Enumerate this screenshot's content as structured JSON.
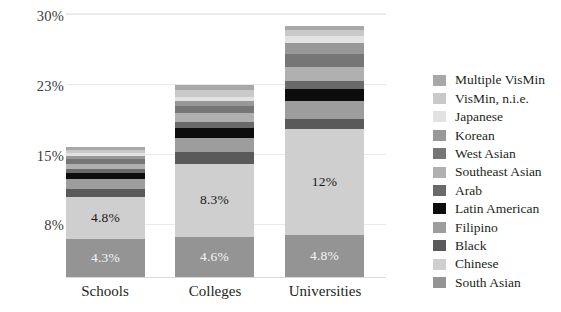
{
  "chart": {
    "type": "bar",
    "title": "",
    "xlabel": "",
    "ylabel": ""
  },
  "axis": {
    "y_ticks": [
      "30%",
      "23%",
      "15%",
      "8%"
    ],
    "x_categories": [
      "Schools",
      "Colleges",
      "Universities"
    ]
  },
  "legend": {
    "items": [
      {
        "label": "Multiple VisMin",
        "color": "#a8a8a8"
      },
      {
        "label": "VisMin, n.i.e.",
        "color": "#c9c9c9"
      },
      {
        "label": "Japanese",
        "color": "#e2e2e2"
      },
      {
        "label": "Korean",
        "color": "#989898"
      },
      {
        "label": "West Asian",
        "color": "#767676"
      },
      {
        "label": "Southeast Asian",
        "color": "#b0b0b0"
      },
      {
        "label": "Arab",
        "color": "#6a6a6a"
      },
      {
        "label": "Latin American",
        "color": "#0d0d0d"
      },
      {
        "label": "Filipino",
        "color": "#9d9d9d"
      },
      {
        "label": "Black",
        "color": "#5a5a5a"
      },
      {
        "label": "Chinese",
        "color": "#cfcfcf"
      },
      {
        "label": "South Asian",
        "color": "#949494"
      }
    ]
  },
  "chart_data": {
    "type": "bar",
    "subtype": "stacked-bar",
    "orientation": "vertical",
    "title": "",
    "xlabel": "",
    "ylabel": "",
    "ylim": [
      0,
      30
    ],
    "ytick_values": [
      8,
      15,
      23,
      30
    ],
    "ytick_labels": [
      "8%",
      "15%",
      "23%",
      "30%"
    ],
    "grid": true,
    "grid_axis": "y",
    "legend_position": "right",
    "categories": [
      "Schools",
      "Colleges",
      "Universities"
    ],
    "series": [
      {
        "name": "South Asian",
        "color": "#949494",
        "values": [
          4.3,
          4.6,
          4.8
        ],
        "labels": [
          "4.3%",
          "4.6%",
          "4.8%"
        ],
        "label_color": "light"
      },
      {
        "name": "Chinese",
        "color": "#cfcfcf",
        "values": [
          4.8,
          8.3,
          12.0
        ],
        "labels": [
          "4.8%",
          "8.3%",
          "12%"
        ],
        "label_color": "dark"
      },
      {
        "name": "Black",
        "color": "#5a5a5a",
        "values": [
          0.9,
          1.3,
          1.2
        ],
        "labels": [
          "",
          "",
          ""
        ]
      },
      {
        "name": "Filipino",
        "color": "#9d9d9d",
        "values": [
          1.1,
          1.6,
          2.0
        ],
        "labels": [
          "",
          "",
          ""
        ]
      },
      {
        "name": "Latin American",
        "color": "#0d0d0d",
        "values": [
          0.7,
          1.1,
          1.4
        ],
        "labels": [
          "",
          "",
          ""
        ]
      },
      {
        "name": "Arab",
        "color": "#6a6a6a",
        "values": [
          0.5,
          0.7,
          0.9
        ],
        "labels": [
          "",
          "",
          ""
        ]
      },
      {
        "name": "Southeast Asian",
        "color": "#b0b0b0",
        "values": [
          0.6,
          1.0,
          1.6
        ],
        "labels": [
          "",
          "",
          ""
        ]
      },
      {
        "name": "West Asian",
        "color": "#767676",
        "values": [
          0.5,
          0.8,
          1.5
        ],
        "labels": [
          "",
          "",
          ""
        ]
      },
      {
        "name": "Korean",
        "color": "#989898",
        "values": [
          0.4,
          0.6,
          1.2
        ],
        "labels": [
          "",
          "",
          ""
        ]
      },
      {
        "name": "Japanese",
        "color": "#e2e2e2",
        "values": [
          0.3,
          0.5,
          0.8
        ],
        "labels": [
          "",
          "",
          ""
        ]
      },
      {
        "name": "VisMin, n.i.e.",
        "color": "#c9c9c9",
        "values": [
          0.4,
          0.8,
          0.7
        ],
        "labels": [
          "",
          "",
          ""
        ]
      },
      {
        "name": "Multiple VisMin",
        "color": "#a8a8a8",
        "values": [
          0.3,
          0.5,
          0.4
        ],
        "labels": [
          "",
          "",
          ""
        ]
      }
    ],
    "totals": [
      14.8,
      21.8,
      28.5
    ]
  }
}
